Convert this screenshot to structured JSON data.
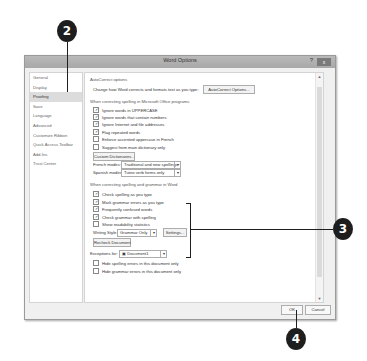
{
  "callouts": [
    {
      "number": "2",
      "target": "nav-item-proofing"
    },
    {
      "number": "3",
      "target": "grammar-section"
    },
    {
      "number": "4",
      "target": "ok-button"
    }
  ],
  "window": {
    "title": "Word Options",
    "help": "?",
    "close": "x"
  },
  "nav": {
    "items": [
      {
        "label": "General"
      },
      {
        "label": "Display"
      },
      {
        "label": "Proofing",
        "active": true
      },
      {
        "label": "Save"
      },
      {
        "label": "Language"
      },
      {
        "label": "Advanced"
      },
      {
        "label": "Customize Ribbon"
      },
      {
        "label": "Quick Access Toolbar"
      },
      {
        "label": "Add-Ins"
      },
      {
        "label": "Trust Center"
      }
    ]
  },
  "content": {
    "autocorrect": {
      "heading": "AutoCorrect options",
      "description": "Change how Word corrects and formats text as you type:",
      "button": "AutoCorrect Options..."
    },
    "office_spelling": {
      "heading": "When correcting spelling in Microsoft Office programs",
      "checkboxes": [
        {
          "label": "Ignore words in UPPERCASE",
          "checked": true,
          "mark": "✓"
        },
        {
          "label": "Ignore words that contain numbers",
          "checked": true,
          "mark": "✓"
        },
        {
          "label": "Ignore Internet and file addresses",
          "checked": true,
          "mark": "✓"
        },
        {
          "label": "Flag repeated words",
          "checked": true,
          "mark": "✓"
        },
        {
          "label": "Enforce accented uppercase in French",
          "checked": false,
          "mark": ""
        },
        {
          "label": "Suggest from main dictionary only",
          "checked": false,
          "mark": ""
        }
      ],
      "custom_dictionaries_button": "Custom Dictionaries...",
      "french_modes_label": "French modes:",
      "french_modes_value": "Traditional and new spellings",
      "spanish_modes_label": "Spanish modes:",
      "spanish_modes_value": "Tuteo verb forms only"
    },
    "word_spelling": {
      "heading": "When correcting spelling and grammar in Word",
      "checkboxes": [
        {
          "label": "Check spelling as you type",
          "checked": true,
          "mark": "✓"
        },
        {
          "label": "Mark grammar errors as you type",
          "checked": true,
          "mark": "✓"
        },
        {
          "label": "Frequently confused words",
          "checked": true,
          "mark": "✓"
        },
        {
          "label": "Check grammar with spelling",
          "checked": true,
          "mark": "✓"
        },
        {
          "label": "Show readability statistics",
          "checked": false,
          "mark": ""
        }
      ],
      "writing_style_label": "Writing Style:",
      "writing_style_value": "Grammar Only",
      "settings_button": "Settings...",
      "recheck_button": "Recheck Document"
    },
    "exceptions": {
      "label": "Exceptions for:",
      "document_value": "Document1",
      "checkboxes": [
        {
          "label": "Hide spelling errors in this document only",
          "checked": false,
          "mark": ""
        },
        {
          "label": "Hide grammar errors in this document only",
          "checked": false,
          "mark": ""
        }
      ]
    }
  },
  "footer": {
    "ok": "OK",
    "cancel": "Cancel"
  },
  "icons": {
    "dropdown": "▾",
    "scroll_up": "▲",
    "scroll_down": "▼",
    "document": "▣"
  }
}
